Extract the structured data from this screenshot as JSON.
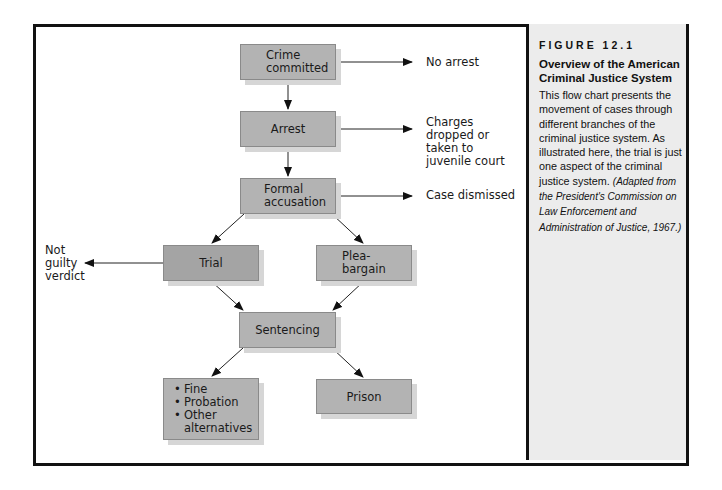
{
  "figure": {
    "number": "FIGURE 12.1",
    "title": "Overview of the American Criminal Justice System",
    "caption": "This flow chart presents the movement of cases through different branches of the criminal justice system. As illustrated here, the trial is just one aspect of the criminal justice system.",
    "source": "(Adapted from the President's Commission on Law Enforcement and Administration of Justice, 1967.)"
  },
  "nodes": {
    "crime": "Crime committed",
    "arrest": "Arrest",
    "accusation": "Formal accusation",
    "trial": "Trial",
    "plea": "Plea-bargain",
    "sentencing": "Sentencing",
    "prison": "Prison",
    "alternatives": [
      "Fine",
      "Probation",
      "Other alternatives"
    ]
  },
  "exits": {
    "no_arrest": "No arrest",
    "charges_dropped": "Charges dropped or taken to juvenile court",
    "case_dismissed": "Case dismissed",
    "not_guilty": "Not guilty verdict"
  },
  "colors": {
    "box_fill": "#b3b3b3",
    "box_fill_dark": "#a4a4a4",
    "sidebar_bg": "#ececec",
    "border": "#111111"
  }
}
